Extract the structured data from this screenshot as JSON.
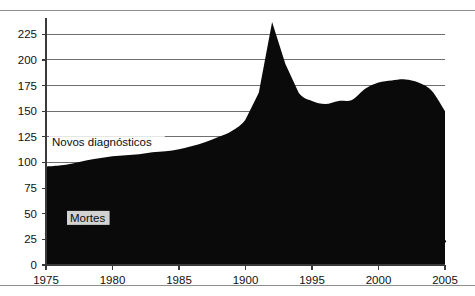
{
  "figure": {
    "title": "",
    "top_rule": true,
    "bottom_rule": true
  },
  "labels": {
    "series_new_diagnoses": "Novos diagnósticos",
    "series_deaths": "Mortes"
  },
  "colors": {
    "area_fill": "#0a0a0a",
    "line_stroke": "#0a0a0a",
    "gridline": "#6f6f6f",
    "axis": "#3a3a3a",
    "rule": "#8d8d8d",
    "background": "#ffffff",
    "text": "#111111"
  },
  "chart_data": {
    "type": "area",
    "title": "",
    "xlabel": "",
    "ylabel": "",
    "xlim": [
      1975,
      2005
    ],
    "ylim": [
      0,
      237
    ],
    "grid": true,
    "legend": "inline-annotations",
    "yticks": [
      0,
      25,
      50,
      75,
      100,
      125,
      150,
      175,
      200,
      225
    ],
    "ytick_labels": [
      "0",
      "25",
      "50",
      "75",
      "100",
      "125",
      "150",
      "175",
      "200",
      "225"
    ],
    "xticks": [
      1975,
      1980,
      1985,
      1990,
      1995,
      2000,
      2005
    ],
    "xtick_labels": [
      "1975",
      "1980",
      "1985",
      "1900",
      "1995",
      "2000",
      "2005"
    ],
    "x": [
      1975,
      1976,
      1977,
      1978,
      1979,
      1980,
      1981,
      1982,
      1983,
      1984,
      1985,
      1986,
      1987,
      1988,
      1989,
      1990,
      1991,
      1992,
      1993,
      1994,
      1995,
      1996,
      1997,
      1998,
      1999,
      2000,
      2001,
      2002,
      2003,
      2004,
      2005
    ],
    "series": [
      {
        "name": "Novos diagnósticos",
        "type": "area",
        "fill": "#0a0a0a",
        "values": [
          96,
          97,
          99,
          102,
          104,
          106,
          107,
          108,
          110,
          111,
          113,
          116,
          120,
          125,
          131,
          142,
          168,
          237,
          196,
          168,
          160,
          157,
          160,
          161,
          172,
          178,
          180,
          181,
          178,
          170,
          150
        ]
      },
      {
        "name": "Mortes",
        "type": "line",
        "stroke": "#0a0a0a",
        "values": [
          31,
          31,
          31,
          32,
          32,
          32,
          32,
          33,
          33,
          33,
          33,
          34,
          34,
          35,
          35,
          36,
          37,
          37,
          37,
          37,
          37,
          36,
          35,
          34,
          33,
          32,
          30,
          28,
          26,
          24,
          23
        ]
      }
    ]
  }
}
